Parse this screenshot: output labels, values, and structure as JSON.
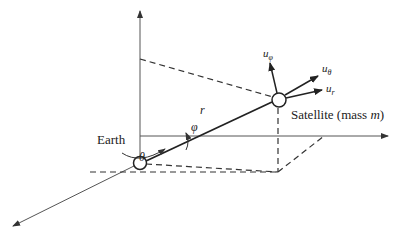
{
  "figure": {
    "type": "spherical-coordinates-diagram",
    "labels": {
      "earth": "Earth",
      "satellite": "Satellite (mass ",
      "satellite_mass_symbol": "m",
      "satellite_close": ")",
      "radius": "r",
      "polar_angle": "φ",
      "azimuth_angle": "θ",
      "unit_phi": "u",
      "unit_phi_sub": "φ",
      "unit_theta": "u",
      "unit_theta_sub": "θ",
      "unit_r": "u",
      "unit_r_sub": "r"
    },
    "colors": {
      "line": "#2a2a2a",
      "axis": "#555555",
      "background": "#ffffff"
    }
  }
}
